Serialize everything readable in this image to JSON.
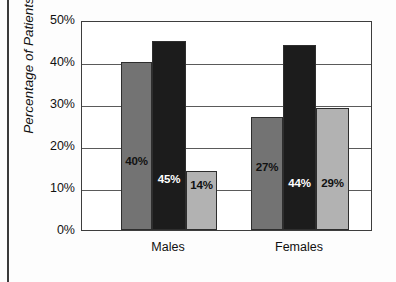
{
  "chart_data": {
    "type": "bar",
    "title": "",
    "xlabel": "",
    "ylabel": "Percentage of Patients",
    "categories": [
      "Males",
      "Females"
    ],
    "ylim": [
      0,
      50
    ],
    "ytick_labels": [
      "0%",
      "10%",
      "20%",
      "30%",
      "40%",
      "50%"
    ],
    "ytick_values": [
      0,
      10,
      20,
      30,
      40,
      50
    ],
    "grid": true,
    "legend": "none",
    "series": [
      {
        "name": "series-1",
        "color": "#737373",
        "values": [
          40,
          27
        ],
        "labels": [
          "40%",
          "27%"
        ],
        "label_color": "#111111"
      },
      {
        "name": "series-2",
        "color": "#1c1c1c",
        "values": [
          45,
          44
        ],
        "labels": [
          "45%",
          "44%"
        ],
        "label_color": "#ffffff"
      },
      {
        "name": "series-3",
        "color": "#b2b2b2",
        "values": [
          14,
          29
        ],
        "labels": [
          "14%",
          "29%"
        ],
        "label_color": "#111111"
      }
    ]
  },
  "axis": {
    "y_title": "Percentage of Patients",
    "ticks": [
      {
        "label": "50%",
        "value": 50
      },
      {
        "label": "40%",
        "value": 40
      },
      {
        "label": "30%",
        "value": 30
      },
      {
        "label": "20%",
        "value": 20
      },
      {
        "label": "10%",
        "value": 10
      },
      {
        "label": "0%",
        "value": 0
      }
    ]
  },
  "categories": [
    {
      "label": "Males"
    },
    {
      "label": "Females"
    }
  ],
  "bars": [
    {
      "name": "males-series-1",
      "group": 0,
      "series": 0,
      "value": 40,
      "label": "40%"
    },
    {
      "name": "males-series-2",
      "group": 0,
      "series": 1,
      "value": 45,
      "label": "45%"
    },
    {
      "name": "males-series-3",
      "group": 0,
      "series": 2,
      "value": 14,
      "label": "14%"
    },
    {
      "name": "females-series-1",
      "group": 1,
      "series": 0,
      "value": 27,
      "label": "27%"
    },
    {
      "name": "females-series-2",
      "group": 1,
      "series": 1,
      "value": 44,
      "label": "44%"
    },
    {
      "name": "females-series-3",
      "group": 1,
      "series": 2,
      "value": 29,
      "label": "29%"
    }
  ],
  "colors": {
    "series_1": "#737373",
    "series_2": "#1c1c1c",
    "series_3": "#b2b2b2",
    "axis": "#3d3d3d",
    "grid": "#5a5a5a",
    "background": "#fdfdfd"
  }
}
